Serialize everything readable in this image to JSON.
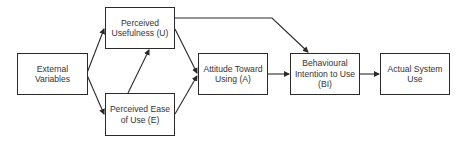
{
  "diagram": {
    "nodes": [
      {
        "id": "ev",
        "label": "External Variables",
        "lines": [
          "External",
          "Variables"
        ],
        "x": 17,
        "y": 53,
        "w": 71,
        "h": 42
      },
      {
        "id": "pu",
        "label": "Perceived Usefulness (U)",
        "lines": [
          "Perceived",
          "Usefulness (U)"
        ],
        "x": 105,
        "y": 7,
        "w": 70,
        "h": 42
      },
      {
        "id": "peou",
        "label": "Perceived Ease of Use (E)",
        "lines": [
          "Perceived Ease",
          "of Use (E)"
        ],
        "x": 105,
        "y": 93,
        "w": 70,
        "h": 43
      },
      {
        "id": "att",
        "label": "Attitude Toward Using (A)",
        "lines": [
          "Attitude Toward",
          "Using (A)"
        ],
        "x": 198,
        "y": 53,
        "w": 70,
        "h": 42
      },
      {
        "id": "bi",
        "label": "Behavioural Intention to Use (BI)",
        "lines": [
          "Behavioural",
          "Intention to Use",
          "(BI)"
        ],
        "x": 290,
        "y": 53,
        "w": 70,
        "h": 42
      },
      {
        "id": "asu",
        "label": "Actual System Use",
        "lines": [
          "Actual System",
          "Use"
        ],
        "x": 380,
        "y": 53,
        "w": 70,
        "h": 42
      }
    ],
    "edges": [
      {
        "from": "ev",
        "to": "pu"
      },
      {
        "from": "ev",
        "to": "peou"
      },
      {
        "from": "peou",
        "to": "pu"
      },
      {
        "from": "pu",
        "to": "att"
      },
      {
        "from": "peou",
        "to": "att"
      },
      {
        "from": "pu",
        "to": "bi"
      },
      {
        "from": "att",
        "to": "bi"
      },
      {
        "from": "bi",
        "to": "asu"
      }
    ],
    "colors": {
      "stroke": "#2a2a2a",
      "text": "#333333",
      "background": "#ffffff"
    }
  }
}
